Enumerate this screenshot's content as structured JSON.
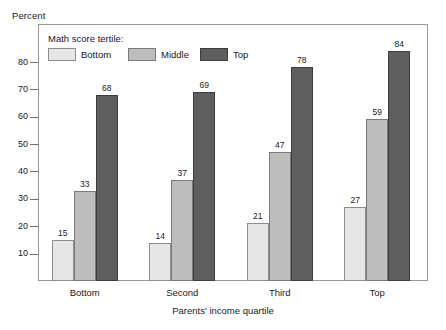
{
  "chart_data": {
    "type": "bar",
    "title": "",
    "ylabel": "Percent",
    "xlabel": "Parents' income quartile",
    "ylim": [
      0,
      87
    ],
    "yticks": [
      10,
      20,
      30,
      40,
      50,
      60,
      70,
      80
    ],
    "ytick_labels": [
      "10",
      "20",
      "30",
      "40",
      "50",
      "60",
      "70",
      "80"
    ],
    "grid": false,
    "legend_title": "Math score tertile:",
    "legend_position": "inside-top-left",
    "categories": [
      "Bottom",
      "Second",
      "Third",
      "Top"
    ],
    "series": [
      {
        "name": "Bottom",
        "color": "#e6e6e6",
        "values": [
          15,
          14,
          21,
          27
        ]
      },
      {
        "name": "Middle",
        "color": "#bdbdbd",
        "values": [
          33,
          37,
          47,
          59
        ]
      },
      {
        "name": "Top",
        "color": "#5e5e5e",
        "values": [
          68,
          69,
          78,
          84
        ]
      }
    ],
    "data_labels": true
  },
  "axes": {
    "y_unit_label": "Percent",
    "x_axis_title": "Parents' income quartile"
  },
  "legend": {
    "title": "Math score tertile:",
    "items": [
      {
        "label": "Bottom",
        "key": "bottom"
      },
      {
        "label": "Middle",
        "key": "middle"
      },
      {
        "label": "Top",
        "key": "top"
      }
    ]
  }
}
